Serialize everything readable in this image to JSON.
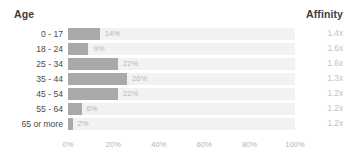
{
  "header": {
    "left_title": "Age",
    "right_title": "Affinity"
  },
  "chart_data": {
    "type": "bar",
    "orientation": "horizontal",
    "title": "",
    "xlabel": "",
    "ylabel": "Age",
    "xlim": [
      0,
      100
    ],
    "grid": false,
    "legend": "none",
    "categories": [
      "0 - 17",
      "18 - 24",
      "25 - 34",
      "35 - 44",
      "45 - 54",
      "55 - 64",
      "65 or more"
    ],
    "values": [
      14,
      9,
      22,
      26,
      22,
      6,
      2
    ],
    "value_labels": [
      "14%",
      "9%",
      "22%",
      "26%",
      "22%",
      "6%",
      "2%"
    ],
    "xticks": [
      0,
      20,
      40,
      60,
      80,
      100
    ],
    "xticklabels": [
      "0%",
      "20%",
      "40%",
      "60%",
      "80%",
      "100%"
    ],
    "series": [
      {
        "name": "Affinity",
        "values": [
          1.4,
          1.6,
          1.6,
          1.3,
          1.2,
          1.2,
          1.2
        ],
        "labels": [
          "1.4x",
          "1.6x",
          "1.6x",
          "1.3x",
          "1.2x",
          "1.2x",
          "1.2x"
        ]
      }
    ],
    "colors": {
      "bar": "#a9a9a9",
      "track": "#f2f2f2",
      "category_text": "#4a4a4a",
      "value_text": "#b7b7b7",
      "affinity_text": "#c2c2c2",
      "axis_text": "#b5b5b5",
      "header_text": "#3c3c3c",
      "background": "#ffffff"
    }
  },
  "rows": [
    {
      "category": "0 - 17",
      "value": 14,
      "value_label": "14%",
      "affinity": "1.4x"
    },
    {
      "category": "18 - 24",
      "value": 9,
      "value_label": "9%",
      "affinity": "1.6x"
    },
    {
      "category": "25 - 34",
      "value": 22,
      "value_label": "22%",
      "affinity": "1.6x"
    },
    {
      "category": "35 - 44",
      "value": 26,
      "value_label": "26%",
      "affinity": "1.3x"
    },
    {
      "category": "45 - 54",
      "value": 22,
      "value_label": "22%",
      "affinity": "1.2x"
    },
    {
      "category": "55 - 64",
      "value": 6,
      "value_label": "6%",
      "affinity": "1.2x"
    },
    {
      "category": "65 or more",
      "value": 2,
      "value_label": "2%",
      "affinity": "1.2x"
    }
  ],
  "axis": {
    "ticks": [
      "0%",
      "20%",
      "40%",
      "60%",
      "80%",
      "100%"
    ],
    "tick_positions": [
      0,
      20,
      40,
      60,
      80,
      100
    ]
  }
}
